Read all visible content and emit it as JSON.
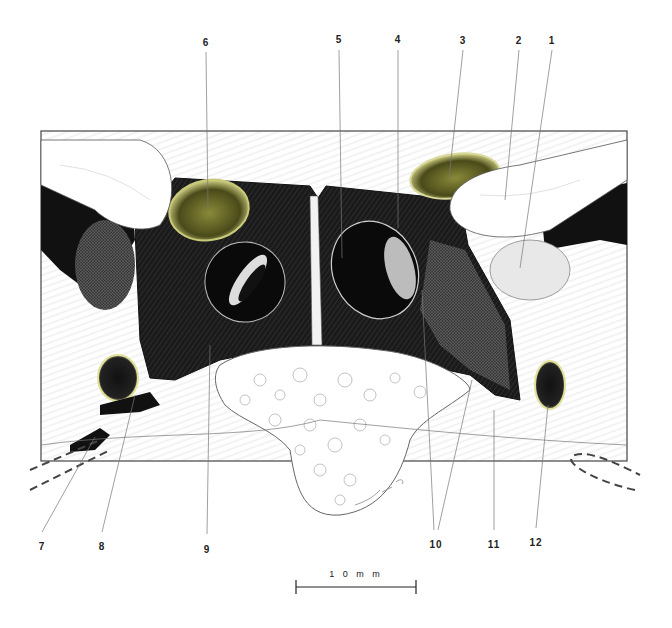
{
  "figure": {
    "type": "anatomical-illustration",
    "colors": {
      "cavity": "#111111",
      "cavity_hatch": "#2a2a2a",
      "ostium_rim": "#d8d89a",
      "ostium_fill": "#6a6a2a",
      "bone": "#f4f4f4",
      "outline": "#333333"
    }
  },
  "labels": {
    "top": [
      {
        "num": "6",
        "x": 206,
        "y": 40
      },
      {
        "num": "5",
        "x": 339,
        "y": 37
      },
      {
        "num": "4",
        "x": 398,
        "y": 37
      },
      {
        "num": "3",
        "x": 463,
        "y": 38
      },
      {
        "num": "2",
        "x": 519,
        "y": 38
      },
      {
        "num": "1",
        "x": 552,
        "y": 38
      }
    ],
    "bottom": [
      {
        "num": "7",
        "x": 42,
        "y": 542
      },
      {
        "num": "8",
        "x": 102,
        "y": 542
      },
      {
        "num": "9",
        "x": 207,
        "y": 545
      },
      {
        "num": "10",
        "x": 436,
        "y": 540
      },
      {
        "num": "11",
        "x": 494,
        "y": 540
      },
      {
        "num": "12",
        "x": 536,
        "y": 538
      }
    ]
  },
  "scale_bar": {
    "label": "1 0  m m",
    "length_mm": 10
  },
  "signature": "lmp 05"
}
